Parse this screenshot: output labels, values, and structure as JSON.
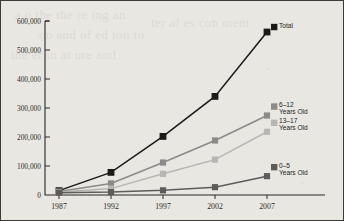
{
  "figure": {
    "background_color": "#e9e7e2",
    "border_color": "#3b3a38",
    "ghost_text": [
      "a o the the re ing an",
      "on and of ed ion to",
      "the er in at ure and",
      "ter al es con ment"
    ]
  },
  "chart_data": {
    "type": "line",
    "title": "",
    "subtitle": "",
    "xlabel": "",
    "ylabel": "",
    "x": [
      1987,
      1992,
      1997,
      2002,
      2007
    ],
    "categories": [
      "1987",
      "1992",
      "1997",
      "2002",
      "2007"
    ],
    "xtick_labels": [
      "1987",
      "1992",
      "1997",
      "2002",
      "2007"
    ],
    "ytick_labels": [
      "0",
      "100,000",
      "200,000",
      "300,000",
      "400,000",
      "500,000",
      "600,000"
    ],
    "ytick_values": [
      0,
      100000,
      200000,
      300000,
      400000,
      500000,
      600000
    ],
    "ylim": [
      0,
      600000
    ],
    "xlim": [
      1987,
      2007
    ],
    "grid": false,
    "legend_position": "right-inline",
    "series": [
      {
        "name": "Total",
        "label_line1": "Total",
        "label_line2": "",
        "color": "#1c1a18",
        "marker": "square",
        "values": [
          15000,
          78000,
          202000,
          340000,
          562000
        ]
      },
      {
        "name": "6-12 Years Old",
        "label_line1": "6–12",
        "label_line2": "Years Old",
        "color": "#8a8a88",
        "marker": "square",
        "values": [
          12000,
          40000,
          112000,
          188000,
          274000
        ]
      },
      {
        "name": "13-17 Years Old",
        "label_line1": "13–17",
        "label_line2": "Years Old",
        "color": "#b6b6b3",
        "marker": "square",
        "values": [
          10000,
          22000,
          73000,
          122000,
          218000
        ]
      },
      {
        "name": "0-5 Years Old",
        "label_line1": "0–5",
        "label_line2": "Years Old",
        "color": "#5e5c5a",
        "marker": "square",
        "values": [
          8000,
          10000,
          16000,
          27000,
          65000
        ]
      }
    ]
  }
}
